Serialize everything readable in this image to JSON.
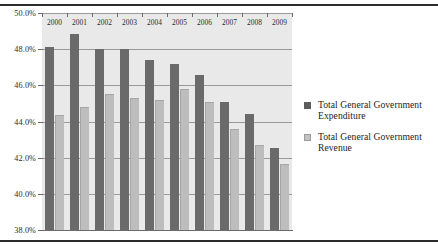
{
  "chart_data": {
    "type": "bar",
    "title": "",
    "subtitle": "",
    "xlabel": "",
    "ylabel": "",
    "categories": [
      "2000",
      "2001",
      "2002",
      "2003",
      "2004",
      "2005",
      "2006",
      "2007",
      "2008",
      "2009"
    ],
    "series": [
      {
        "name": "Total General Government Expenditure",
        "color": "#6a6a6a",
        "values": [
          48.1,
          48.85,
          48.0,
          48.0,
          47.4,
          47.2,
          46.55,
          45.1,
          44.4,
          42.55
        ]
      },
      {
        "name": "Total General Government Revenue",
        "color": "#bdbdbd",
        "values": [
          44.35,
          44.8,
          45.5,
          45.3,
          45.2,
          45.8,
          45.1,
          43.6,
          42.7,
          41.65
        ]
      }
    ],
    "ylim": [
      38.0,
      50.0
    ],
    "ytick_values": [
      38.0,
      40.0,
      42.0,
      44.0,
      46.0,
      48.0,
      50.0
    ],
    "ytick_labels": [
      "38.0%",
      "40.0%",
      "42.0%",
      "44.0%",
      "46.0%",
      "48.0%",
      "50.0%"
    ],
    "grid": true,
    "legend_position": "right",
    "plot_background": "#e9e9e9"
  },
  "legend": {
    "items": [
      {
        "label": "Total General Government Expenditure",
        "swatch": "expenditure"
      },
      {
        "label": "Total General Government Revenue",
        "swatch": "revenue"
      }
    ]
  },
  "rules": {
    "top": "horizontal-rule",
    "bottom": "horizontal-rule"
  }
}
